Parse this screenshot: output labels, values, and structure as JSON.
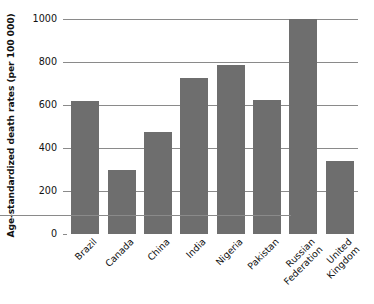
{
  "chart_data": {
    "type": "bar",
    "title": "",
    "xlabel": "",
    "ylabel": "Age-standardized death rates (per 100 000)",
    "ylim": [
      0,
      1000
    ],
    "yticks": [
      0,
      200,
      400,
      600,
      800,
      1000
    ],
    "ytick_labels": [
      "0",
      "200",
      "400",
      "600",
      "800",
      "1000"
    ],
    "grid": true,
    "legend": "none",
    "bar_color": "#6e6e6e",
    "gridline_color": "#8a8a8a",
    "categories": [
      "Brazil",
      "Canada",
      "China",
      "India",
      "Nigeria",
      "Pakistan",
      "Russian Federation",
      "United Kingdom"
    ],
    "category_label_lines": [
      [
        "Brazil"
      ],
      [
        "Canada"
      ],
      [
        "China"
      ],
      [
        "India"
      ],
      [
        "Nigeria"
      ],
      [
        "Pakistan"
      ],
      [
        "Russian",
        "Federation"
      ],
      [
        "United",
        "Kingdom"
      ]
    ],
    "values": [
      620,
      300,
      475,
      725,
      785,
      625,
      1000,
      340
    ]
  }
}
